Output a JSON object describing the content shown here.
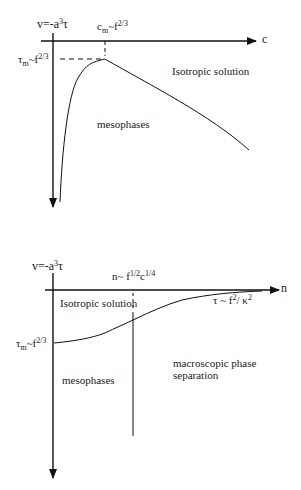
{
  "top_diagram": {
    "y_axis_label": {
      "base": "v=-a",
      "sup": "3",
      "tail": "τ"
    },
    "x_axis_label": "c",
    "peak_x_label": {
      "base": "c",
      "sub": "m",
      "mid": "~f",
      "sup": "2/3"
    },
    "peak_y_label": {
      "base": "τ",
      "sub": "m",
      "mid": "~f",
      "sup": "2/3"
    },
    "region_upper": "Isotropic solution",
    "region_lower": "mesophases"
  },
  "bottom_diagram": {
    "y_axis_label": {
      "base": "v=-a",
      "sup": "3",
      "tail": "τ"
    },
    "x_axis_label": "n",
    "boundary_label": {
      "base": "n~ f",
      "sup1": "1/2",
      "mid": "c",
      "sup2": "1/4"
    },
    "curve_asymptote_label": {
      "base": "τ ~ f",
      "sup1": "2",
      "mid": "/ κ",
      "sup2": "2"
    },
    "intercept_label": {
      "base": "τ",
      "sub": "m",
      "mid": "~f",
      "sup": "2/3"
    },
    "region_upper": "Isotropic solution",
    "region_lower_left": "mesophases",
    "region_lower_right_line1": "macroscopic phase",
    "region_lower_right_line2": "separation"
  },
  "colors": {
    "line": "#111111",
    "background": "#ffffff"
  }
}
